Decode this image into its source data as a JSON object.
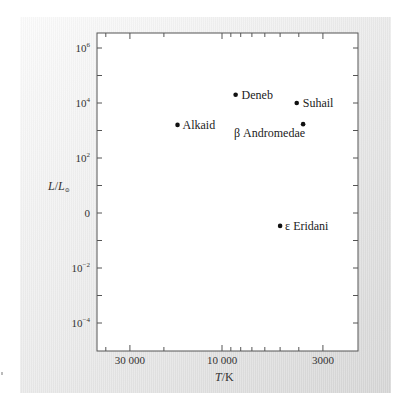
{
  "chart_data": {
    "type": "scatter",
    "title": "",
    "xlabel": "T/K",
    "ylabel": "L/L⊙",
    "x_scale": "log",
    "x_reversed": true,
    "y_scale": "log",
    "xlim": [
      50000,
      2200
    ],
    "ylim": [
      1e-05,
      2000000
    ],
    "grid": false,
    "legend": "none",
    "x_ticks": [
      {
        "value": 30000,
        "label": "30 000"
      },
      {
        "value": 10000,
        "label": "10 000"
      },
      {
        "value": 3000,
        "label": "3000"
      }
    ],
    "y_ticks": [
      {
        "value": 1000000,
        "base": "10",
        "exp": "6"
      },
      {
        "value": 10000,
        "base": "10",
        "exp": "4"
      },
      {
        "value": 100,
        "base": "10",
        "exp": "2"
      },
      {
        "value": 1,
        "base": "0",
        "exp": ""
      },
      {
        "value": 0.01,
        "base": "10",
        "exp": "−2"
      },
      {
        "value": 0.0001,
        "base": "10",
        "exp": "−4"
      }
    ],
    "points": [
      {
        "name": "Deneb",
        "T": 8500,
        "L": 20000
      },
      {
        "name": "Suhail",
        "T": 4100,
        "L": 10000
      },
      {
        "name": "Alkaid",
        "T": 17000,
        "L": 1600
      },
      {
        "name": "β Andromedae",
        "T": 3800,
        "L": 1700
      },
      {
        "name": "ε Eridani",
        "T": 5000,
        "L": 0.34
      }
    ]
  },
  "axes": {
    "x_label_italic": "T",
    "x_label_rest": "/K",
    "y_label_italic": "L",
    "y_label_mid": "/",
    "y_label_italic2": "L",
    "y_label_sub": "⊙"
  },
  "colors": {
    "axis": "#555555",
    "point": "#111111",
    "text": "#222222"
  }
}
